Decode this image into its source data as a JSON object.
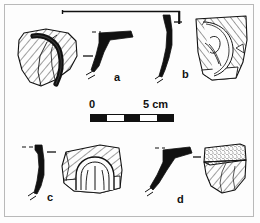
{
  "plate": {
    "caption_labels": [
      {
        "id": "a",
        "text": "a"
      },
      {
        "id": "b",
        "text": "b"
      },
      {
        "id": "c",
        "text": "c"
      },
      {
        "id": "d",
        "text": "d"
      }
    ],
    "scale": {
      "start_label": "0",
      "end_label": "5 cm",
      "unit": "cm",
      "length_cm": 5,
      "segments": [
        "dark",
        "light",
        "dark",
        "light",
        "dark"
      ],
      "segment_count": 5
    },
    "colors": {
      "ink": "#111111",
      "frame": "#b9b9b9",
      "paper": "#fdfdfd",
      "hatch": "#2a2a2a",
      "stipple": "#3a3a3a"
    },
    "objects": [
      {
        "id": "a",
        "name": "sherd-a",
        "type": "body-sherd-with-applied-handle",
        "surface": "diagonal-hatching",
        "has_profile": true,
        "profile_style": "solid-black-angular-rim"
      },
      {
        "id": "b",
        "name": "sherd-b",
        "type": "rim-sherd-with-spiral-relief",
        "surface": "diagonal-hatching",
        "has_profile": true,
        "profile_style": "solid-black-curved-wall"
      },
      {
        "id": "c",
        "name": "sherd-c",
        "type": "body-sherd-with-arched-applied-band",
        "surface": "diagonal-hatching",
        "has_profile": true,
        "profile_style": "solid-black-curved-wall"
      },
      {
        "id": "d",
        "name": "sherd-d",
        "type": "rim-sherd-with-stippled-band",
        "surface": "stipple-and-hatching",
        "has_profile": true,
        "profile_style": "solid-black-everted-rim"
      }
    ],
    "rim_line": {
      "name": "diameter-reference-line",
      "orientation": "horizontal"
    }
  }
}
